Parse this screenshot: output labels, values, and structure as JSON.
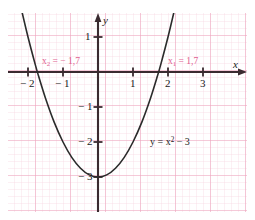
{
  "chart_data": {
    "type": "line",
    "title": "",
    "subtitle": "",
    "xlabel": "x",
    "ylabel": "y",
    "xlim": [
      -2.45,
      3.35
    ],
    "ylim": [
      -3.85,
      1.7
    ],
    "grid": true,
    "grid_minor_step": 0.2,
    "grid_major_step": 1,
    "legend": "none",
    "function_label": "y = x² − 3",
    "function_label_parts": {
      "lhs": "y = x",
      "exponent": "2",
      "rhs": "− 3"
    },
    "series": [
      {
        "name": "y = x² − 3",
        "equation": "y = x^2 - 3",
        "color": "#2b2b2b",
        "points": [
          {
            "x": -2.32,
            "y": 2.38
          },
          {
            "x": -2.2,
            "y": 1.84
          },
          {
            "x": -2.0,
            "y": 1.0
          },
          {
            "x": -1.8,
            "y": 0.24
          },
          {
            "x": -1.7,
            "y": -0.11
          },
          {
            "x": -1.5,
            "y": -0.75
          },
          {
            "x": -1.25,
            "y": -1.44
          },
          {
            "x": -1.0,
            "y": -2.0
          },
          {
            "x": -0.75,
            "y": -2.44
          },
          {
            "x": -0.5,
            "y": -2.75
          },
          {
            "x": -0.25,
            "y": -2.94
          },
          {
            "x": 0.0,
            "y": -3.0
          },
          {
            "x": 0.25,
            "y": -2.94
          },
          {
            "x": 0.5,
            "y": -2.75
          },
          {
            "x": 0.75,
            "y": -2.44
          },
          {
            "x": 1.0,
            "y": -2.0
          },
          {
            "x": 1.25,
            "y": -1.44
          },
          {
            "x": 1.5,
            "y": -0.75
          },
          {
            "x": 1.7,
            "y": -0.11
          },
          {
            "x": 1.8,
            "y": 0.24
          },
          {
            "x": 2.0,
            "y": 1.0
          },
          {
            "x": 2.2,
            "y": 1.84
          },
          {
            "x": 2.32,
            "y": 2.38
          }
        ]
      }
    ],
    "roots": [
      {
        "name": "x₁",
        "symbol": "x",
        "index": "1",
        "value": "1,7",
        "numeric": 1.7,
        "label": "x₁ = 1,7"
      },
      {
        "name": "x₂",
        "symbol": "x",
        "index": "2",
        "value": "− 1,7",
        "numeric": -1.7,
        "label": "x₂ = − 1,7"
      }
    ],
    "vertex": {
      "x": 0,
      "y": -3
    },
    "x_ticks": [
      {
        "value": -2,
        "label": "− 2"
      },
      {
        "value": -1,
        "label": "− 1"
      },
      {
        "value": 1,
        "label": "1"
      },
      {
        "value": 2,
        "label": "2"
      },
      {
        "value": 3,
        "label": "3"
      }
    ],
    "y_ticks": [
      {
        "value": 1,
        "label": "1"
      },
      {
        "value": -1,
        "label": "− 1"
      },
      {
        "value": -2,
        "label": "− 2"
      },
      {
        "value": -3,
        "label": "− 3"
      }
    ],
    "colors": {
      "grid_minor": "#f7d2de",
      "grid_major": "#eda3bd",
      "axis": "#3a2b30",
      "curve": "#2b2b2b",
      "root_label": "#e0608f",
      "background": "#ffffff"
    }
  }
}
